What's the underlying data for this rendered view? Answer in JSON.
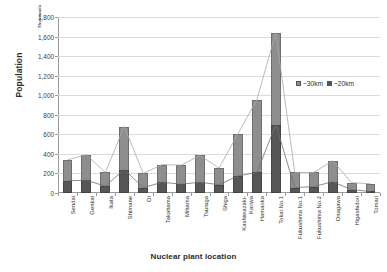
{
  "chart_data": {
    "type": "bar",
    "title": "",
    "xlabel": "Nuclear plant location",
    "ylabel": "Population",
    "units_label": "Thousands",
    "ylim": [
      0,
      1800
    ],
    "ytick_step": 200,
    "ytick_labels": [
      "1,800",
      "1,600",
      "1,400",
      "1,200",
      "1,000",
      "800",
      "600",
      "400",
      "200",
      "0"
    ],
    "grid": true,
    "legend_position": "inside-right",
    "stacked": true,
    "overlay": "line-markers-on-both-series",
    "categories": [
      "Sendai",
      "Genkai",
      "Ikata",
      "Shimane",
      "Oi",
      "Takahama",
      "Mihama",
      "Tsuruga",
      "Shiga",
      "Kashiwazaki-\nKariwa",
      "Hamaoka",
      "Tokai No.1",
      "Fukushima No.1",
      "Fukushima No.2",
      "Onagawa",
      "Higashidori",
      "Tomari"
    ],
    "series": [
      {
        "name": "~30km",
        "color": "#8e8e8e",
        "values": [
          340,
          390,
          210,
          680,
          200,
          290,
          285,
          385,
          255,
          605,
          955,
          1640,
          210,
          210,
          330,
          105,
          95
        ]
      },
      {
        "name": "~20km",
        "color": "#565656",
        "values": [
          125,
          130,
          70,
          240,
          55,
          110,
          90,
          110,
          85,
          175,
          210,
          700,
          55,
          65,
          115,
          35,
          15
        ]
      }
    ]
  },
  "legend": {
    "items": [
      {
        "label": "~30km",
        "icon": "square-swatch-light"
      },
      {
        "label": "~20km",
        "icon": "square-swatch-dark"
      }
    ]
  },
  "axes": {
    "y_title": "Population",
    "x_title": "Nuclear plant location",
    "units": "Thousands"
  }
}
